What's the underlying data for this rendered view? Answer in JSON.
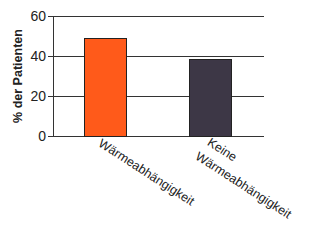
{
  "chart_data": {
    "type": "bar",
    "title": "",
    "xlabel": "",
    "ylabel": "% der Patienten",
    "ylim": [
      0,
      60
    ],
    "yticks": [
      0,
      20,
      40,
      60
    ],
    "grid": true,
    "legend": null,
    "categories": [
      "Wärmeabhängigkeit",
      "Keine Wärmeabhängigkeit"
    ],
    "values": [
      49,
      38.5
    ],
    "colors": [
      "#FF5A1A",
      "#3D3746"
    ]
  },
  "axis": {
    "ylabel": "% der Patienten",
    "ticks": [
      "0",
      "20",
      "40",
      "60"
    ]
  },
  "labels": {
    "cat1": "Wärmeabhängigkeit",
    "cat2_line1": "Keine",
    "cat2_line2": "Wärmeabhängigkeit"
  }
}
